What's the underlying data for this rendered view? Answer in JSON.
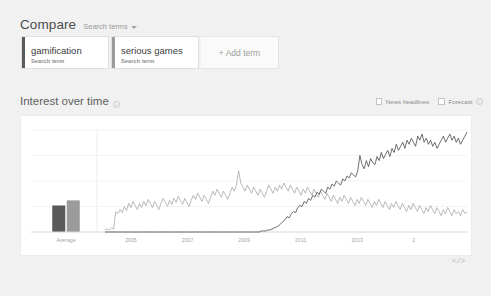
{
  "header": {
    "compare_title": "Compare",
    "scope_label": "Search terms",
    "caret_icon": "chevron-down-icon"
  },
  "terms": [
    {
      "name": "gamification",
      "subtitle": "Search term",
      "color": "#5a5a5a"
    },
    {
      "name": "serious games",
      "subtitle": "Search term",
      "color": "#9b9b9b"
    }
  ],
  "add_term_label": "+ Add term",
  "interest_section": {
    "title": "Interest over time",
    "info_icon": "info-icon",
    "controls": [
      {
        "label": "News headlines",
        "checked": false,
        "icon": "checkbox-icon"
      },
      {
        "label": "Forecast",
        "checked": false,
        "icon": "checkbox-icon"
      }
    ],
    "forecast_info_icon": "info-icon"
  },
  "embed_label": "</>",
  "chart_data": {
    "type": "line",
    "title": "Interest over time",
    "xlabel": "",
    "ylabel": "",
    "ylim": [
      0,
      100
    ],
    "grid": true,
    "legend": "none",
    "average_panel": {
      "label": "Average",
      "bars": [
        {
          "name": "gamification",
          "value": 26,
          "color": "#5a5a5a"
        },
        {
          "name": "serious games",
          "value": 31,
          "color": "#9b9b9b"
        }
      ]
    },
    "x_ticks": [
      "2005",
      "2007",
      "2009",
      "2011",
      "2013",
      "2"
    ],
    "series": [
      {
        "name": "gamification",
        "color": "#4a4a4a",
        "values": [
          0,
          0,
          0,
          0,
          0,
          0,
          0,
          0,
          0,
          0,
          0,
          0,
          0,
          0,
          0,
          0,
          0,
          0,
          0,
          0,
          0,
          0,
          0,
          0,
          0,
          0,
          0,
          0,
          0,
          0,
          0,
          0,
          0,
          0,
          0,
          0,
          0,
          0,
          0,
          0,
          0,
          0,
          0,
          0,
          0,
          0,
          0,
          0,
          0,
          0,
          0,
          0,
          0,
          0,
          0,
          0,
          0,
          0,
          0,
          0,
          0,
          0,
          0,
          0,
          0,
          0,
          0,
          0,
          0,
          0,
          0,
          0,
          0,
          1,
          1,
          1,
          2,
          2,
          3,
          4,
          5,
          6,
          8,
          10,
          12,
          15,
          14,
          18,
          20,
          19,
          24,
          26,
          25,
          30,
          28,
          33,
          31,
          36,
          34,
          39,
          37,
          42,
          40,
          38,
          44,
          42,
          47,
          45,
          50,
          48,
          46,
          52,
          50,
          55,
          53,
          58,
          56,
          54,
          60,
          75,
          66,
          62,
          70,
          64,
          72,
          68,
          66,
          74,
          70,
          78,
          72,
          76,
          80,
          74,
          82,
          78,
          86,
          80,
          84,
          88,
          82,
          90,
          86,
          92,
          88,
          84,
          94,
          90,
          96,
          88,
          92,
          86,
          90,
          84,
          88,
          82,
          86,
          90,
          94,
          88,
          92,
          96,
          90,
          94,
          88,
          92,
          86,
          90,
          94,
          98
        ]
      },
      {
        "name": "serious games",
        "color": "#a8a8a8",
        "values": [
          2,
          3,
          2,
          4,
          3,
          20,
          18,
          22,
          19,
          25,
          21,
          28,
          24,
          30,
          26,
          22,
          28,
          24,
          30,
          26,
          32,
          28,
          24,
          30,
          26,
          22,
          28,
          33,
          29,
          25,
          31,
          27,
          33,
          29,
          35,
          31,
          27,
          33,
          29,
          25,
          31,
          36,
          32,
          38,
          34,
          30,
          36,
          32,
          28,
          34,
          40,
          36,
          42,
          38,
          34,
          40,
          36,
          32,
          38,
          44,
          40,
          46,
          60,
          48,
          44,
          40,
          46,
          42,
          38,
          44,
          40,
          36,
          42,
          38,
          34,
          40,
          46,
          42,
          38,
          44,
          40,
          46,
          42,
          48,
          44,
          40,
          46,
          42,
          38,
          44,
          40,
          36,
          42,
          38,
          44,
          40,
          36,
          42,
          38,
          34,
          40,
          36,
          32,
          38,
          34,
          30,
          36,
          32,
          28,
          34,
          30,
          36,
          32,
          28,
          34,
          30,
          26,
          32,
          28,
          34,
          30,
          26,
          32,
          28,
          24,
          30,
          26,
          32,
          28,
          24,
          30,
          26,
          22,
          28,
          24,
          30,
          26,
          22,
          28,
          24,
          20,
          26,
          22,
          28,
          24,
          20,
          26,
          22,
          18,
          24,
          20,
          26,
          22,
          18,
          24,
          20,
          16,
          22,
          18,
          24,
          20,
          16,
          22,
          18,
          20,
          16,
          22,
          18,
          20
        ]
      }
    ]
  }
}
